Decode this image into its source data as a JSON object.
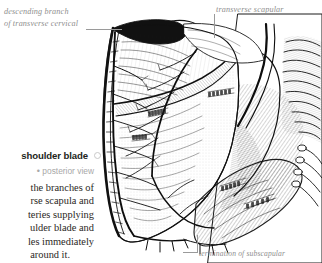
{
  "page": {
    "background_color": "#ffffff",
    "width": 322,
    "height": 263
  },
  "labels": {
    "descending_branch": {
      "line1": "descending branch",
      "line2": "of transverse cervical",
      "color": "#8e8e8e"
    },
    "transverse_scapular": {
      "text": "transverse scapular",
      "color": "#8e8e8e"
    },
    "termination_subscapular": {
      "text": "termination of subscapular",
      "color": "#8e8e8e"
    }
  },
  "caption": {
    "title": "shoulder blade",
    "title_color": "#231f20",
    "circle_icon": "circle-icon",
    "subtitle_bullet": "•",
    "subtitle": "posterior view",
    "subtitle_color": "#a8a8a8",
    "body_lines": [
      "the branches of",
      "rse scapula and",
      "teries supplying",
      "ulder blade and",
      "les immediately",
      "around it."
    ],
    "body_color": "#2b2725"
  },
  "illustration": {
    "name": "scapula-posterior-view-engraving",
    "style": "steel engraving, black ink hatching on white",
    "ink_color": "#1a1a1a",
    "engraved_muscle_labels": [
      "SUPRASPINATUS",
      "INFRASPINATUS",
      "TERES MINOR",
      "TERES MAJOR",
      "RHOMBOIDEUS",
      "LATISSIMUS DORSI",
      "SUBSCAPULAR"
    ]
  }
}
